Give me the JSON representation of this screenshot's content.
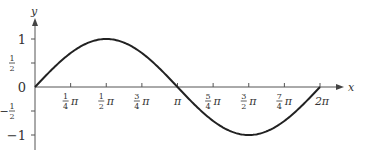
{
  "chart_data": {
    "type": "line",
    "title": "",
    "function": "y = sin x",
    "xlabel": "x",
    "ylabel": "y",
    "xlim": [
      0,
      6.2832
    ],
    "ylim": [
      -1.5,
      1.5
    ],
    "grid": false,
    "legend": null,
    "x_ticks": [
      {
        "value": 0.7854,
        "num": "1",
        "den": "4",
        "sym": "π"
      },
      {
        "value": 1.5708,
        "num": "1",
        "den": "2",
        "sym": "π"
      },
      {
        "value": 2.3562,
        "num": "3",
        "den": "4",
        "sym": "π"
      },
      {
        "value": 3.1416,
        "num": "",
        "den": "",
        "sym": "π"
      },
      {
        "value": 3.927,
        "num": "5",
        "den": "4",
        "sym": "π"
      },
      {
        "value": 4.7124,
        "num": "3",
        "den": "2",
        "sym": "π"
      },
      {
        "value": 5.4978,
        "num": "7",
        "den": "4",
        "sym": "π"
      },
      {
        "value": 6.2832,
        "num": "",
        "den": "",
        "sym": "2π"
      }
    ],
    "y_ticks": [
      {
        "value": 1,
        "label": "1"
      },
      {
        "value": 0.5,
        "label": "1/2"
      },
      {
        "value": 0,
        "label": "0"
      },
      {
        "value": -0.5,
        "label": "−1/2"
      },
      {
        "value": -1,
        "label": "−1"
      }
    ],
    "series": [
      {
        "name": "sin x",
        "x": [
          0,
          0.7854,
          1.5708,
          2.3562,
          3.1416,
          3.927,
          4.7124,
          5.4978,
          6.2832
        ],
        "y": [
          0,
          0.7071,
          1,
          0.7071,
          0,
          -0.7071,
          -1,
          -0.7071,
          0
        ]
      }
    ]
  },
  "axes": {
    "x_label": "x",
    "y_label": "y"
  }
}
